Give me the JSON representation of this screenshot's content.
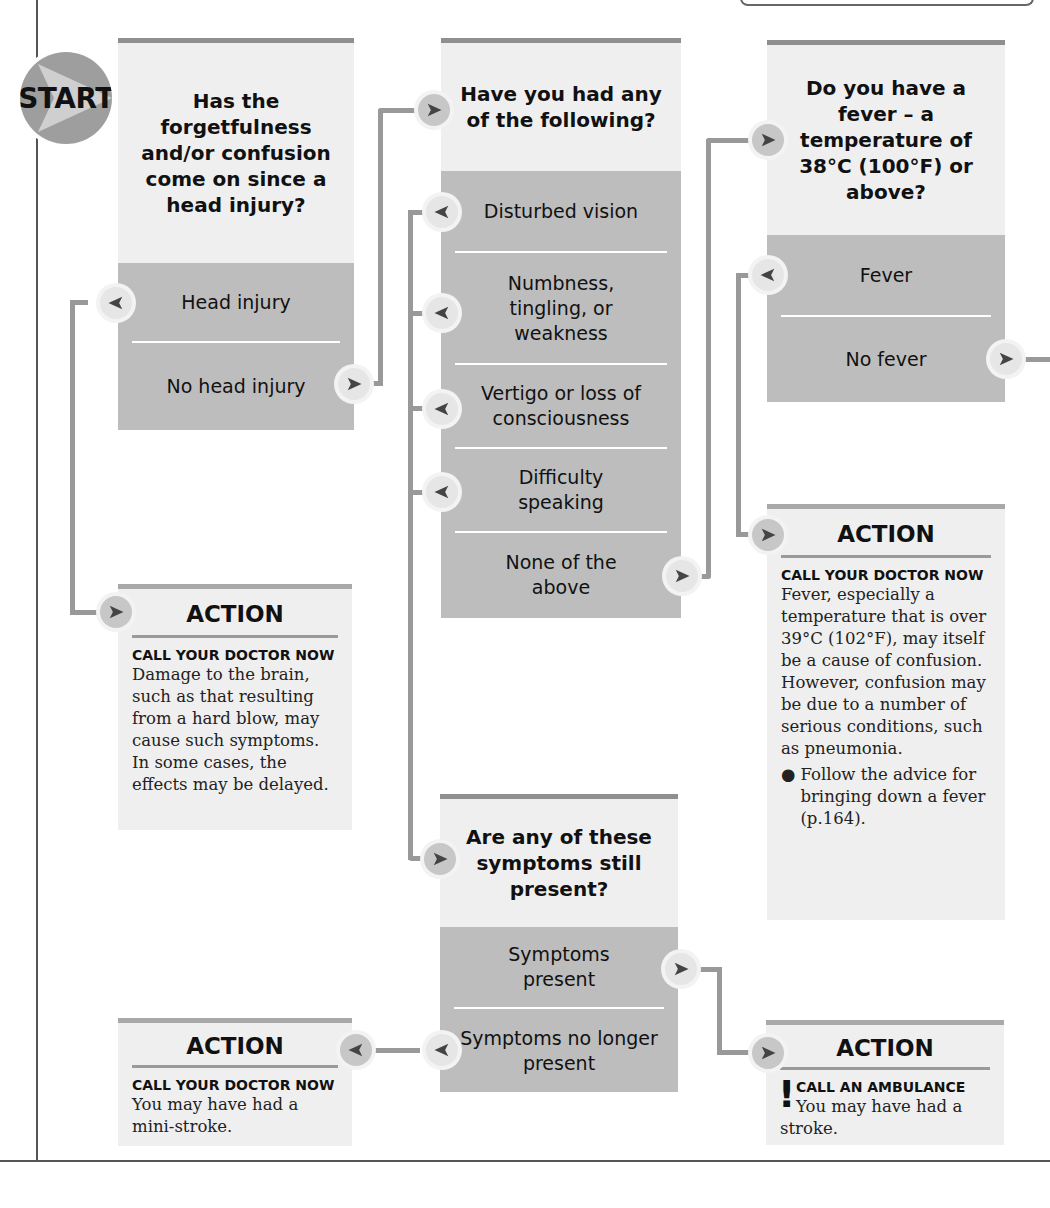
{
  "colors": {
    "question_bg": "#efefef",
    "options_bg": "#bdbdbd",
    "top_bar": "#8f8f8f",
    "connector": "#999999",
    "node_fill": "#c7c7c7",
    "arrow": "#444444"
  },
  "start": {
    "label": "START",
    "icon": "start-arrow-icon"
  },
  "q1": {
    "question": "Has the forgetfulness and/or confusion come on since a head injury?",
    "options": [
      {
        "label": "Head injury",
        "arrow": "left"
      },
      {
        "label": "No head injury",
        "arrow": "right"
      }
    ]
  },
  "q2": {
    "question": "Have you had any of the following?",
    "options": [
      {
        "label": "Disturbed vision",
        "arrow": "left"
      },
      {
        "label": "Numbness, tingling, or weakness",
        "arrow": "left"
      },
      {
        "label": "Vertigo or loss of consciousness",
        "arrow": "left"
      },
      {
        "label": "Difficulty speaking",
        "arrow": "left"
      },
      {
        "label": "None of the above",
        "arrow": "right"
      }
    ]
  },
  "q3": {
    "question": "Do you have a fever – a temperature of 38°C (100°F) or above?",
    "options": [
      {
        "label": "Fever",
        "arrow": "left"
      },
      {
        "label": "No fever",
        "arrow": "right"
      }
    ]
  },
  "q4": {
    "question": "Are any of these symptoms still present?",
    "options": [
      {
        "label": "Symptoms present",
        "arrow": "right"
      },
      {
        "label": "Symptoms no longer present",
        "arrow": "left"
      }
    ]
  },
  "actions": {
    "head_injury": {
      "title": "ACTION",
      "heading": "CALL YOUR DOCTOR NOW",
      "body": "Damage to the brain, such as that resulting from a hard blow, may cause such symptoms. In some cases, the effects may be delayed."
    },
    "fever": {
      "title": "ACTION",
      "heading": "CALL YOUR DOCTOR NOW",
      "body": "Fever, especially a temperature that is over 39°C (102°F), may itself be a cause of confusion. However, confusion may be due to a number of serious conditions, such as pneumonia.",
      "bullet": "Follow the advice for bringing down a fever (p.164)."
    },
    "mini_stroke": {
      "title": "ACTION",
      "heading": "CALL YOUR DOCTOR NOW",
      "body": "You may have had a mini-stroke."
    },
    "stroke": {
      "title": "ACTION",
      "urgent_mark": "!",
      "heading": "CALL AN AMBULANCE",
      "body": "You may have had a stroke."
    }
  }
}
